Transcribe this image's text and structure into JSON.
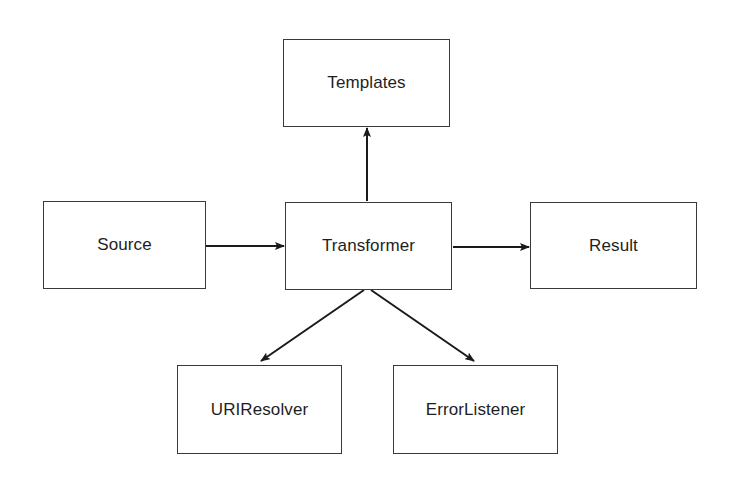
{
  "diagram": {
    "nodes": [
      {
        "id": "templates",
        "label": "Templates",
        "x": 283,
        "y": 39,
        "w": 167,
        "h": 88
      },
      {
        "id": "source",
        "label": "Source",
        "x": 43,
        "y": 201,
        "w": 163,
        "h": 88
      },
      {
        "id": "transformer",
        "label": "Transformer",
        "x": 285,
        "y": 202,
        "w": 167,
        "h": 88
      },
      {
        "id": "result",
        "label": "Result",
        "x": 530,
        "y": 202,
        "w": 167,
        "h": 87
      },
      {
        "id": "uriresolver",
        "label": "URIResolver",
        "x": 177,
        "y": 365,
        "w": 165,
        "h": 89
      },
      {
        "id": "errorlistener",
        "label": "ErrorListener",
        "x": 393,
        "y": 365,
        "w": 165,
        "h": 89
      }
    ],
    "edges": [
      {
        "from": "source",
        "to": "transformer",
        "x1": 206,
        "y1": 246,
        "x2": 284,
        "y2": 246
      },
      {
        "from": "transformer",
        "to": "templates",
        "x1": 367,
        "y1": 201,
        "x2": 367,
        "y2": 128
      },
      {
        "from": "transformer",
        "to": "result",
        "x1": 453,
        "y1": 247,
        "x2": 529,
        "y2": 247
      },
      {
        "from": "transformer",
        "to": "uriresolver",
        "x1": 364,
        "y1": 290,
        "x2": 261,
        "y2": 361
      },
      {
        "from": "transformer",
        "to": "errorlistener",
        "x1": 371,
        "y1": 290,
        "x2": 474,
        "y2": 361
      }
    ],
    "colors": {
      "stroke": "#1a1a1a",
      "box_border": "#3a3a3a",
      "text": "#1e1e1e",
      "background": "#ffffff"
    }
  }
}
